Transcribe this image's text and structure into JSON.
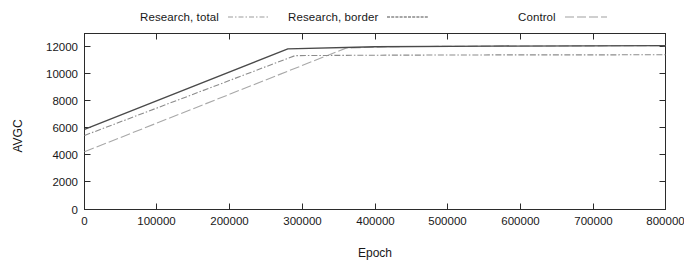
{
  "chart_data": {
    "type": "line",
    "title": "",
    "xlabel": "Epoch",
    "ylabel": "AVGC",
    "xlim": [
      0,
      800000
    ],
    "ylim": [
      0,
      13000
    ],
    "x_ticks": [
      0,
      100000,
      200000,
      300000,
      400000,
      500000,
      600000,
      700000,
      800000
    ],
    "x_tick_labels": [
      "0",
      "100000",
      "200000",
      "300000",
      "400000",
      "500000",
      "600000",
      "700000",
      "800000"
    ],
    "y_ticks": [
      0,
      2000,
      4000,
      6000,
      8000,
      10000,
      12000
    ],
    "y_tick_labels": [
      "0",
      "2000",
      "4000",
      "6000",
      "8000",
      "10000",
      "12000"
    ],
    "grid": false,
    "legend_position": "above-plot",
    "series": [
      {
        "name": "Research, total",
        "style": "dash-dot",
        "color": "#8c8c8c",
        "x": [
          0,
          290000,
          400000,
          560000,
          800000
        ],
        "values": [
          5450,
          11330,
          11360,
          11380,
          11390
        ]
      },
      {
        "name": "Research, border",
        "style": "solid",
        "color": "#4a4a4a",
        "x": [
          0,
          280000,
          400000,
          560000,
          800000
        ],
        "values": [
          5900,
          11830,
          11980,
          12030,
          12060
        ]
      },
      {
        "name": "Control",
        "style": "dotted",
        "color": "#a8a8a8",
        "x": [
          0,
          360000,
          420000,
          560000,
          800000
        ],
        "values": [
          4250,
          11880,
          11990,
          12030,
          12060
        ]
      }
    ]
  },
  "legend": {
    "entries": [
      {
        "label": "Research, total"
      },
      {
        "label": "Research, border"
      },
      {
        "label": "Control"
      }
    ]
  },
  "axes": {
    "y_title": "AVGC",
    "x_title": "Epoch",
    "y_labels": [
      "12000",
      "10000",
      "8000",
      "6000",
      "4000",
      "2000",
      "0"
    ],
    "x_labels": [
      "0",
      "100000",
      "200000",
      "300000",
      "400000",
      "500000",
      "600000",
      "700000",
      "800000"
    ]
  }
}
